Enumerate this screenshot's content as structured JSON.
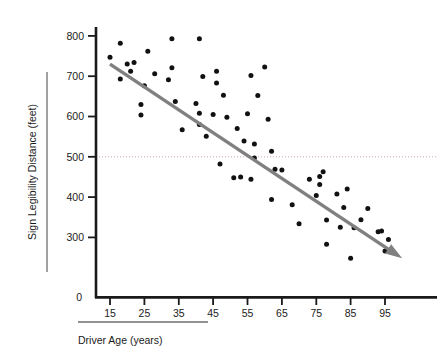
{
  "chart_data": {
    "type": "scatter",
    "title": "",
    "xlabel": "Driver Age (years)",
    "ylabel": "Sign Legibility Distance (feet)",
    "xlim": [
      10,
      103
    ],
    "ylim": [
      210,
      820
    ],
    "xticks": [
      15,
      25,
      35,
      45,
      55,
      65,
      75,
      85,
      95
    ],
    "yticks": [
      300,
      400,
      500,
      600,
      700,
      800
    ],
    "origin_label": "0",
    "grid": false,
    "legend": null,
    "series": [
      {
        "name": "Observations",
        "marker": "filled-circle",
        "color": "#111111",
        "points": [
          [
            15,
            747
          ],
          [
            18,
            782
          ],
          [
            18,
            693
          ],
          [
            20,
            730
          ],
          [
            21,
            712
          ],
          [
            22,
            734
          ],
          [
            24,
            630
          ],
          [
            24,
            604
          ],
          [
            25,
            676
          ],
          [
            26,
            762
          ],
          [
            28,
            706
          ],
          [
            32,
            691
          ],
          [
            33,
            793
          ],
          [
            33,
            721
          ],
          [
            34,
            637
          ],
          [
            36,
            567
          ],
          [
            40,
            632
          ],
          [
            41,
            608
          ],
          [
            41,
            793
          ],
          [
            41,
            580
          ],
          [
            42,
            699
          ],
          [
            43,
            551
          ],
          [
            45,
            605
          ],
          [
            46,
            683
          ],
          [
            46,
            712
          ],
          [
            47,
            482
          ],
          [
            48,
            653
          ],
          [
            49,
            598
          ],
          [
            51,
            448
          ],
          [
            52,
            570
          ],
          [
            53,
            450
          ],
          [
            54,
            539
          ],
          [
            55,
            607
          ],
          [
            56,
            444
          ],
          [
            56,
            702
          ],
          [
            57,
            532
          ],
          [
            57,
            497
          ],
          [
            58,
            652
          ],
          [
            60,
            723
          ],
          [
            61,
            593
          ],
          [
            62,
            514
          ],
          [
            62,
            394
          ],
          [
            63,
            469
          ],
          [
            65,
            467
          ],
          [
            68,
            381
          ],
          [
            70,
            334
          ],
          [
            73,
            444
          ],
          [
            75,
            404
          ],
          [
            76,
            431
          ],
          [
            76,
            451
          ],
          [
            77,
            463
          ],
          [
            78,
            343
          ],
          [
            78,
            283
          ],
          [
            81,
            408
          ],
          [
            82,
            325
          ],
          [
            83,
            374
          ],
          [
            84,
            420
          ],
          [
            85,
            248
          ],
          [
            86,
            324
          ],
          [
            88,
            344
          ],
          [
            90,
            372
          ],
          [
            93,
            314
          ],
          [
            94,
            316
          ],
          [
            95,
            266
          ],
          [
            96,
            295
          ]
        ]
      }
    ],
    "trend_line": {
      "name": "Fitted trend line",
      "color": "#808080",
      "arrow": true,
      "start": [
        15,
        730
      ],
      "end": [
        100,
        248
      ],
      "slope": -5.67,
      "intercept": 815
    },
    "reference_line": {
      "name": "Reference line at 500 feet",
      "orientation": "horizontal",
      "value": 500,
      "style": "dotted",
      "color": "#c8a8b4"
    }
  },
  "axes": {
    "x_title": "Driver Age (years)",
    "y_title": "Sign Legibility Distance (feet)",
    "origin": "0"
  }
}
